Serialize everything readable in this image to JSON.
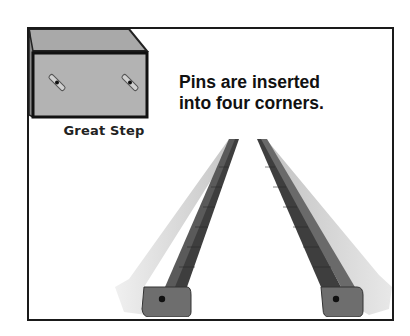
{
  "illustration": {
    "caption": "Great Step",
    "headline_line1": "Pins are inserted",
    "headline_line2": "into four corners.",
    "objects": [
      {
        "name": "great-step-box",
        "description": "gray box with two diagonal pins on front face"
      },
      {
        "name": "left-rail",
        "description": "tapered rail in perspective with pin hole"
      },
      {
        "name": "right-rail",
        "description": "tapered rail in perspective with pin hole"
      }
    ],
    "colors": {
      "frame": "#1a1a1a",
      "box_top": "#a8a8a8",
      "box_front": "#b4b4b4",
      "rail_dark": "#555555",
      "rail_light": "#d8d8d8"
    }
  }
}
